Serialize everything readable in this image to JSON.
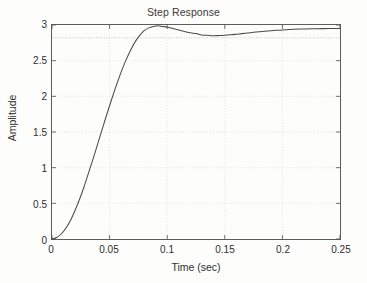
{
  "chart_data": {
    "type": "line",
    "title": "Step Response",
    "xlabel": "Time (sec)",
    "ylabel": "Amplitude",
    "xlim": [
      0,
      0.25
    ],
    "ylim": [
      0,
      3
    ],
    "xticks": [
      0,
      0.05,
      0.1,
      0.15,
      0.2,
      0.25
    ],
    "xtick_labels": [
      "0",
      "0.05",
      "0.1",
      "0.15",
      "0.2",
      "0.25"
    ],
    "yticks": [
      0,
      0.5,
      1,
      1.5,
      2,
      2.5,
      3
    ],
    "ytick_labels": [
      "0",
      "0.5",
      "1",
      "1.5",
      "2",
      "2.5",
      "3"
    ],
    "grid": true,
    "grid_style": "dotted",
    "legend": null,
    "line_color": "#4a4a4a",
    "grid_color": "#d8d8d8",
    "axis_color": "#5d5d5d",
    "reference_lines": [
      {
        "orientation": "horizontal",
        "value": 2.82,
        "style": "dotted",
        "color": "#b5b5b5"
      }
    ],
    "annotations": [],
    "series": [
      {
        "name": "Step Response",
        "x": [
          0,
          0.004,
          0.008,
          0.012,
          0.016,
          0.02,
          0.024,
          0.028,
          0.032,
          0.036,
          0.04,
          0.044,
          0.048,
          0.052,
          0.056,
          0.06,
          0.064,
          0.068,
          0.072,
          0.076,
          0.08,
          0.084,
          0.088,
          0.092,
          0.096,
          0.1,
          0.105,
          0.11,
          0.115,
          0.12,
          0.125,
          0.13,
          0.135,
          0.14,
          0.145,
          0.15,
          0.155,
          0.16,
          0.165,
          0.17,
          0.175,
          0.18,
          0.185,
          0.19,
          0.195,
          0.2,
          0.21,
          0.22,
          0.23,
          0.24,
          0.25
        ],
        "values": [
          0.0,
          0.02,
          0.07,
          0.15,
          0.26,
          0.4,
          0.56,
          0.74,
          0.94,
          1.14,
          1.35,
          1.56,
          1.77,
          1.97,
          2.16,
          2.34,
          2.5,
          2.64,
          2.76,
          2.85,
          2.92,
          2.96,
          2.98,
          2.99,
          2.98,
          2.97,
          2.95,
          2.93,
          2.91,
          2.89,
          2.88,
          2.86,
          2.855,
          2.85,
          2.852,
          2.856,
          2.862,
          2.87,
          2.879,
          2.888,
          2.897,
          2.905,
          2.913,
          2.92,
          2.926,
          2.931,
          2.939,
          2.945,
          2.948,
          2.95,
          2.951
        ]
      }
    ],
    "peak": {
      "x": 0.092,
      "y": 2.99
    },
    "valley": {
      "x": 0.14,
      "y": 2.85
    },
    "steady_state": 2.95
  }
}
